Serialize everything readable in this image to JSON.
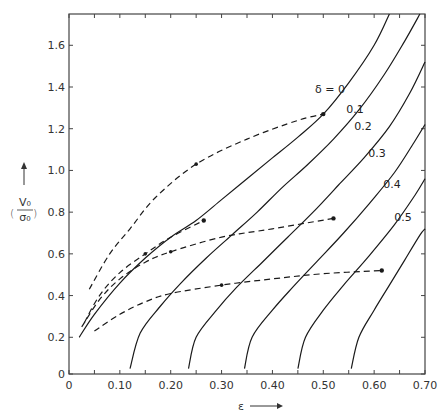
{
  "chart_data": {
    "type": "line",
    "title": "",
    "xlabel": "ε",
    "ylabel": "(V0/σ0)",
    "xlim": [
      0,
      0.7
    ],
    "ylim": [
      0,
      1.75
    ],
    "x_ticks": [
      "0",
      "0.10",
      "0.20",
      "0.30",
      "0.40",
      "0.50",
      "0.60",
      "0.70"
    ],
    "y_ticks": [
      "0",
      "0.2",
      "0.4",
      "0.6",
      "0.8",
      "1.0",
      "1.2",
      "1.4",
      "1.6"
    ],
    "grid": false,
    "legend": "inline curve labels",
    "series": [
      {
        "name": "δ = 0",
        "label": "δ = 0",
        "style": "solid",
        "points": [
          [
            0.02,
            0.2
          ],
          [
            0.05,
            0.31
          ],
          [
            0.1,
            0.46
          ],
          [
            0.15,
            0.58
          ],
          [
            0.2,
            0.68
          ],
          [
            0.25,
            0.76
          ],
          [
            0.3,
            0.86
          ],
          [
            0.35,
            0.96
          ],
          [
            0.4,
            1.06
          ],
          [
            0.45,
            1.16
          ],
          [
            0.5,
            1.27
          ],
          [
            0.55,
            1.42
          ],
          [
            0.6,
            1.6
          ],
          [
            0.63,
            1.75
          ]
        ]
      },
      {
        "name": "δ = 0.1",
        "label": "0.1",
        "style": "solid",
        "points": [
          [
            0.12,
            0.05
          ],
          [
            0.14,
            0.22
          ],
          [
            0.18,
            0.35
          ],
          [
            0.22,
            0.46
          ],
          [
            0.27,
            0.58
          ],
          [
            0.32,
            0.69
          ],
          [
            0.37,
            0.8
          ],
          [
            0.42,
            0.92
          ],
          [
            0.47,
            1.03
          ],
          [
            0.52,
            1.15
          ],
          [
            0.57,
            1.29
          ],
          [
            0.62,
            1.46
          ],
          [
            0.66,
            1.62
          ],
          [
            0.69,
            1.75
          ]
        ]
      },
      {
        "name": "δ = 0.2",
        "label": "0.2",
        "style": "solid",
        "points": [
          [
            0.235,
            0.05
          ],
          [
            0.25,
            0.2
          ],
          [
            0.29,
            0.33
          ],
          [
            0.33,
            0.44
          ],
          [
            0.38,
            0.56
          ],
          [
            0.43,
            0.68
          ],
          [
            0.48,
            0.8
          ],
          [
            0.53,
            0.93
          ],
          [
            0.58,
            1.06
          ],
          [
            0.63,
            1.21
          ],
          [
            0.67,
            1.37
          ],
          [
            0.7,
            1.52
          ]
        ]
      },
      {
        "name": "δ = 0.3",
        "label": "0.3",
        "style": "solid",
        "points": [
          [
            0.345,
            0.05
          ],
          [
            0.36,
            0.2
          ],
          [
            0.4,
            0.33
          ],
          [
            0.44,
            0.44
          ],
          [
            0.49,
            0.57
          ],
          [
            0.54,
            0.7
          ],
          [
            0.59,
            0.84
          ],
          [
            0.64,
            0.99
          ],
          [
            0.68,
            1.14
          ],
          [
            0.7,
            1.22
          ]
        ]
      },
      {
        "name": "δ = 0.4",
        "label": "0.4",
        "style": "solid",
        "points": [
          [
            0.45,
            0.05
          ],
          [
            0.465,
            0.2
          ],
          [
            0.5,
            0.33
          ],
          [
            0.54,
            0.45
          ],
          [
            0.59,
            0.59
          ],
          [
            0.64,
            0.74
          ],
          [
            0.68,
            0.88
          ],
          [
            0.7,
            0.96
          ]
        ]
      },
      {
        "name": "δ = 0.5",
        "label": "0.5",
        "style": "solid",
        "points": [
          [
            0.555,
            0.05
          ],
          [
            0.57,
            0.2
          ],
          [
            0.6,
            0.33
          ],
          [
            0.63,
            0.45
          ],
          [
            0.66,
            0.57
          ],
          [
            0.69,
            0.69
          ],
          [
            0.7,
            0.72
          ]
        ]
      },
      {
        "name": "path A",
        "style": "dashed",
        "points": [
          [
            0.04,
            0.43
          ],
          [
            0.08,
            0.6
          ],
          [
            0.12,
            0.72
          ],
          [
            0.17,
            0.87
          ],
          [
            0.25,
            1.03
          ],
          [
            0.35,
            1.15
          ],
          [
            0.45,
            1.24
          ],
          [
            0.5,
            1.27
          ]
        ]
      },
      {
        "name": "path B",
        "style": "dashed",
        "points": [
          [
            0.03,
            0.27
          ],
          [
            0.06,
            0.4
          ],
          [
            0.1,
            0.51
          ],
          [
            0.15,
            0.6
          ],
          [
            0.2,
            0.68
          ],
          [
            0.265,
            0.76
          ]
        ]
      },
      {
        "name": "path C",
        "style": "dashed",
        "points": [
          [
            0.025,
            0.25
          ],
          [
            0.06,
            0.38
          ],
          [
            0.1,
            0.48
          ],
          [
            0.15,
            0.56
          ],
          [
            0.2,
            0.61
          ],
          [
            0.3,
            0.68
          ],
          [
            0.4,
            0.72
          ],
          [
            0.52,
            0.77
          ]
        ]
      },
      {
        "name": "path D",
        "style": "dashed",
        "points": [
          [
            0.05,
            0.23
          ],
          [
            0.1,
            0.31
          ],
          [
            0.15,
            0.37
          ],
          [
            0.2,
            0.41
          ],
          [
            0.3,
            0.45
          ],
          [
            0.4,
            0.48
          ],
          [
            0.5,
            0.505
          ],
          [
            0.615,
            0.52
          ]
        ]
      }
    ],
    "axis_arrows": {
      "x": "ε →",
      "y": "↑"
    }
  }
}
